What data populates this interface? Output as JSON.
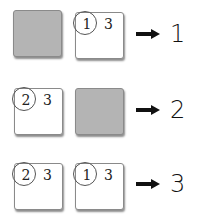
{
  "rows": [
    {
      "boxes": [
        {
          "type": "gray"
        },
        {
          "type": "white",
          "circled": "1",
          "other": "3"
        }
      ],
      "result": "1"
    },
    {
      "boxes": [
        {
          "type": "white",
          "circled": "2",
          "other": "3"
        },
        {
          "type": "gray"
        }
      ],
      "result": "2"
    },
    {
      "boxes": [
        {
          "type": "white",
          "circled": "2",
          "other": "3"
        },
        {
          "type": "white",
          "circled": "1",
          "other": "3"
        }
      ],
      "result": "3"
    }
  ],
  "colors": {
    "gray_box": "#b4b4b4",
    "border": "#8a8a8a",
    "arrow": "#111111"
  }
}
